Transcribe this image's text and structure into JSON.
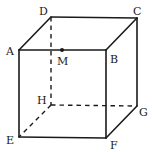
{
  "figure": {
    "type": "cube",
    "stroke_color": "#1a1a1a",
    "background": "#ffffff",
    "vertices": {
      "A": {
        "label": "A",
        "x": 19,
        "y": 50
      },
      "B": {
        "label": "B",
        "x": 106,
        "y": 50
      },
      "C": {
        "label": "C",
        "x": 137,
        "y": 18
      },
      "D": {
        "label": "D",
        "x": 51,
        "y": 17
      },
      "E": {
        "label": "E",
        "x": 19,
        "y": 137
      },
      "F": {
        "label": "F",
        "x": 106,
        "y": 138
      },
      "G": {
        "label": "G",
        "x": 137,
        "y": 106
      },
      "H": {
        "label": "H",
        "x": 51,
        "y": 105
      }
    },
    "point_M": {
      "label": "M",
      "x": 62,
      "y": 50,
      "on_edge": "AB"
    },
    "visible_edges": [
      "AB",
      "BC",
      "CD",
      "DA",
      "AE",
      "EF",
      "FB",
      "FG",
      "GC"
    ],
    "hidden_edges": [
      "DH",
      "HE",
      "HG"
    ]
  }
}
